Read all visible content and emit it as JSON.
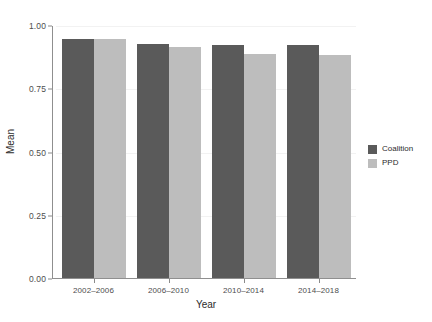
{
  "chart_data": {
    "type": "bar",
    "title": "",
    "subtitle": "",
    "xlabel": "Year",
    "ylabel": "Mean",
    "categories": [
      "2002–2006",
      "2006–2010",
      "2010–2014",
      "2014–2018"
    ],
    "series": [
      {
        "name": "Coalition",
        "color": "#5a5a5a",
        "values": [
          0.945,
          0.925,
          0.92,
          0.92
        ]
      },
      {
        "name": "PPD",
        "color": "#bdbdbd",
        "values": [
          0.945,
          0.915,
          0.885,
          0.88
        ]
      }
    ],
    "ylim": [
      0.0,
      1.0
    ],
    "yticks": [
      0.0,
      0.25,
      0.5,
      0.75,
      1.0
    ],
    "ytick_labels": [
      "0.00",
      "0.25",
      "0.50",
      "0.75",
      "1.00"
    ],
    "grid": true,
    "grid_color": "#f2f2f2",
    "legend_position": "right",
    "legend_title": "",
    "background": "#ffffff",
    "bar_mode": "grouped"
  },
  "legend": {
    "entries": [
      {
        "label": "Coalition",
        "color": "#5a5a5a"
      },
      {
        "label": "PPD",
        "color": "#bdbdbd"
      }
    ]
  },
  "axes": {
    "y_title": "Mean",
    "x_title": "Year"
  }
}
